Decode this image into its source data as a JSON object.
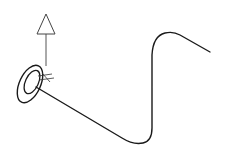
{
  "diagram": {
    "background": "#ffffff",
    "stroke_color": "#1a1a1a",
    "arrow_color": "#444444",
    "elements": {
      "up_arrow": {
        "label": "up-vector arrow",
        "tip": [
          46,
          14
        ],
        "base_left": [
          37,
          34
        ],
        "base_right": [
          55,
          34
        ],
        "shaft_start": [
          46,
          34
        ],
        "shaft_end": [
          46,
          64
        ]
      },
      "start_marker": {
        "label": "start rings",
        "outer": {
          "cx": 30,
          "cy": 84,
          "rx": 11,
          "ry": 20,
          "rotate": 25
        },
        "inner": {
          "cx": 32,
          "cy": 82,
          "rx": 7,
          "ry": 13,
          "rotate": 25
        }
      },
      "path": {
        "label": "swept path curve",
        "d": "M 36 87 L 122 138 Q 133 145 143 143 Q 152 141 152 128 L 152 55 Q 153 36 165 33 Q 173 31 180 35 L 210 52"
      }
    }
  }
}
